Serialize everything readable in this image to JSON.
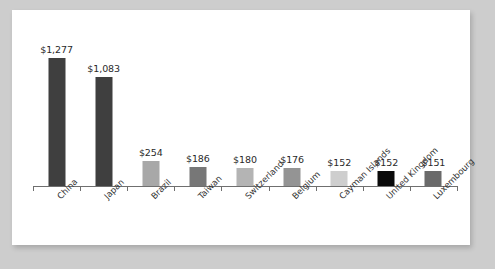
{
  "chart_data": {
    "type": "bar",
    "title": "",
    "subtitle": "",
    "xlabel": "",
    "ylabel": "",
    "ylim": [
      0,
      1277
    ],
    "grid": false,
    "legend": "none",
    "value_prefix": "$",
    "categories": [
      "China",
      "Japan",
      "Brazil",
      "Taiwan",
      "Switzerland",
      "Belgium",
      "Cayman Islands",
      "United Kingdom",
      "Luxembourg"
    ],
    "values": [
      1277,
      1083,
      254,
      186,
      180,
      176,
      152,
      152,
      151
    ],
    "value_labels": [
      "$1,277",
      "$1,083",
      "$254",
      "$186",
      "$180",
      "$176",
      "$152",
      "$152",
      "$151"
    ],
    "bar_colors": [
      "#3f3f3f",
      "#3f3f3f",
      "#a8a8a8",
      "#777777",
      "#b4b4b4",
      "#949494",
      "#cecece",
      "#0a0a0a",
      "#6a6a6a"
    ],
    "axis_color": "#6f6f6f",
    "label_color": "#2a2a2a",
    "card_color": "#ffffff",
    "background_color": "#cdcdcd"
  }
}
